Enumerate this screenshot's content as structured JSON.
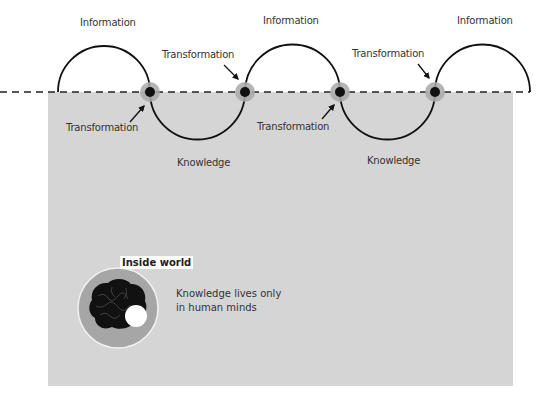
{
  "diagram": {
    "labels": {
      "information": [
        "Information",
        "Information",
        "Information"
      ],
      "knowledge": [
        "Knowledge",
        "Knowledge"
      ],
      "transformation_above": [
        "Transformation",
        "Transformation"
      ],
      "transformation_below": [
        "Transformation",
        "Transformation"
      ]
    },
    "inside_world": {
      "title": "Inside world",
      "description_line1": "Knowledge lives only",
      "description_line2": "in human minds"
    },
    "colors": {
      "panel": "#d5d5d5",
      "stroke": "#111111",
      "node_halo": "#a8a8a8",
      "node_core": "#111111",
      "inner_circle": "#a6a6a6",
      "brain": "#111111"
    }
  }
}
